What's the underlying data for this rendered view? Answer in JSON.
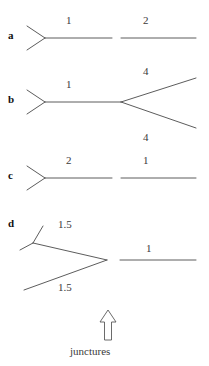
{
  "figure": {
    "title": "",
    "background_color": "#ffffff",
    "line_color": "#4a4a4a",
    "text_color": "#3a3a3a",
    "width": 209,
    "height": 366,
    "rows": [
      {
        "letter": "a",
        "letter_x": 8,
        "letter_y": 30,
        "left_fork": {
          "vertex_x": 45,
          "vertex_y": 38,
          "upper_end_x": 27,
          "upper_end_y": 26,
          "lower_end_x": 27,
          "lower_end_y": 50
        },
        "right_structure": "straight",
        "segments": [
          {
            "label": "1",
            "label_x": 66,
            "label_y": 15,
            "x1": 45,
            "y1": 38,
            "x2": 112,
            "y2": 38
          },
          {
            "label": "2",
            "label_x": 143,
            "label_y": 15,
            "x1": 121,
            "y1": 38,
            "x2": 196,
            "y2": 38
          }
        ]
      },
      {
        "letter": "b",
        "letter_x": 8,
        "letter_y": 94,
        "left_fork": {
          "vertex_x": 45,
          "vertex_y": 102,
          "upper_end_x": 27,
          "upper_end_y": 90,
          "lower_end_x": 27,
          "lower_end_y": 114
        },
        "right_structure": "fork",
        "right_fork": {
          "vertex_x": 121,
          "vertex_y": 102,
          "upper_end_x": 196,
          "upper_end_y": 78,
          "lower_end_x": 196,
          "lower_end_y": 128
        },
        "segments": [
          {
            "label": "1",
            "label_x": 66,
            "label_y": 79,
            "x1": 45,
            "y1": 102,
            "x2": 121,
            "y2": 102
          },
          {
            "label": "4",
            "label_x": 143,
            "label_y": 66,
            "x1": 121,
            "y1": 102,
            "x2": 196,
            "y2": 78
          },
          {
            "label": "4",
            "label_x": 143,
            "label_y": 132,
            "x1": 121,
            "y1": 102,
            "x2": 196,
            "y2": 128
          }
        ]
      },
      {
        "letter": "c",
        "letter_x": 8,
        "letter_y": 170,
        "left_fork": {
          "vertex_x": 45,
          "vertex_y": 178,
          "upper_end_x": 27,
          "upper_end_y": 166,
          "lower_end_x": 27,
          "lower_end_y": 190
        },
        "right_structure": "straight",
        "segments": [
          {
            "label": "2",
            "label_x": 66,
            "label_y": 155,
            "x1": 45,
            "y1": 178,
            "x2": 112,
            "y2": 178
          },
          {
            "label": "1",
            "label_x": 143,
            "label_y": 155,
            "x1": 121,
            "y1": 178,
            "x2": 196,
            "y2": 178
          }
        ]
      },
      {
        "letter": "d",
        "letter_x": 8,
        "letter_y": 218,
        "left_structure": "big-fork-with-small-fork",
        "big_fork": {
          "vertex_x": 107,
          "vertex_y": 260,
          "upper_end_x": 33,
          "upper_end_y": 243,
          "lower_end_x": 24,
          "lower_end_y": 290
        },
        "small_fork": {
          "vertex_x": 33,
          "vertex_y": 243,
          "upper_end_x": 43,
          "upper_end_y": 226,
          "lower_end_x": 20,
          "lower_end_y": 250
        },
        "right_structure": "straight",
        "segments": [
          {
            "label": "1.5",
            "label_x": 58,
            "label_y": 219,
            "x1": 33,
            "y1": 243,
            "x2": 107,
            "y2": 260
          },
          {
            "label": "1.5",
            "label_x": 58,
            "label_y": 282,
            "x1": 24,
            "y1": 290,
            "x2": 107,
            "y2": 260
          },
          {
            "label": "1",
            "label_x": 146,
            "label_y": 243,
            "x1": 120,
            "y1": 260,
            "x2": 196,
            "y2": 260
          }
        ]
      }
    ],
    "annotation": {
      "arrow_label": "junctures",
      "arrow_label_x": 70,
      "arrow_label_y": 345,
      "arrow_direction": "up",
      "arrow_x": 108,
      "arrow_tip_y": 310,
      "arrow_tail_y": 340
    }
  }
}
